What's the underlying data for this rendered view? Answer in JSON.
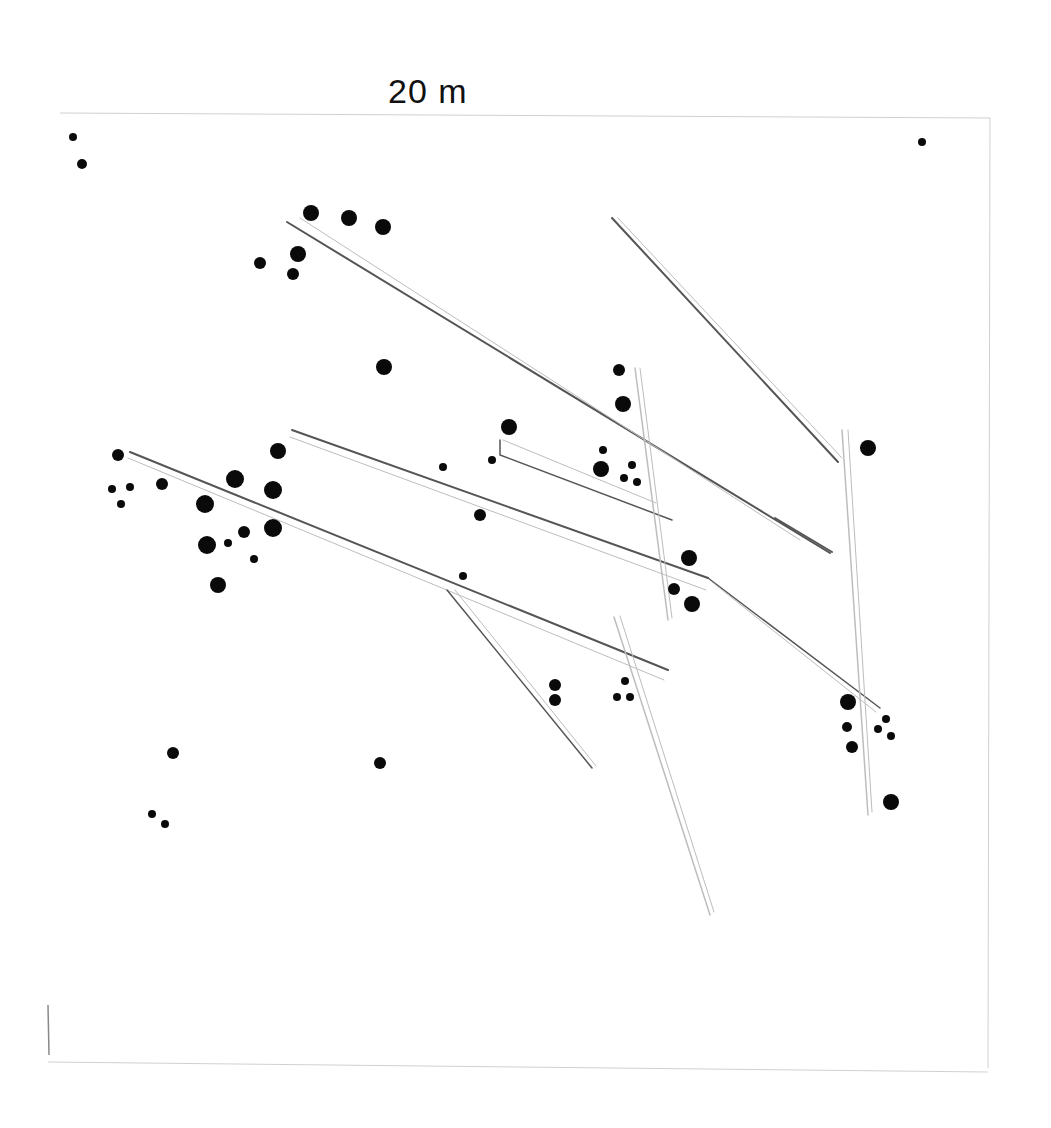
{
  "diagram": {
    "scale_label": "20 m",
    "colors": {
      "ink": "#0a0a0a",
      "line": "#555555",
      "faint": "#bdbdbd",
      "background": "#ffffff"
    },
    "frame": {
      "top": {
        "x1": 60,
        "y1": 113,
        "x2": 990,
        "y2": 118
      },
      "right": {
        "x1": 990,
        "y1": 118,
        "x2": 988,
        "y2": 1068
      },
      "bottom": {
        "x1": 48,
        "y1": 1062,
        "x2": 988,
        "y2": 1072
      },
      "left_mark": {
        "x1": 48,
        "y1": 1005,
        "x2": 49,
        "y2": 1055
      }
    },
    "dots": [
      {
        "x": 73,
        "y": 137,
        "r": 4
      },
      {
        "x": 82,
        "y": 164,
        "r": 5
      },
      {
        "x": 922,
        "y": 142,
        "r": 4
      },
      {
        "x": 311,
        "y": 213,
        "r": 8
      },
      {
        "x": 349,
        "y": 218,
        "r": 8
      },
      {
        "x": 383,
        "y": 227,
        "r": 8
      },
      {
        "x": 298,
        "y": 254,
        "r": 8
      },
      {
        "x": 260,
        "y": 263,
        "r": 6
      },
      {
        "x": 293,
        "y": 274,
        "r": 6
      },
      {
        "x": 384,
        "y": 367,
        "r": 8
      },
      {
        "x": 619,
        "y": 370,
        "r": 6
      },
      {
        "x": 623,
        "y": 404,
        "r": 8
      },
      {
        "x": 509,
        "y": 427,
        "r": 8
      },
      {
        "x": 868,
        "y": 448,
        "r": 8
      },
      {
        "x": 118,
        "y": 455,
        "r": 6
      },
      {
        "x": 278,
        "y": 451,
        "r": 8
      },
      {
        "x": 235,
        "y": 479,
        "r": 9
      },
      {
        "x": 162,
        "y": 484,
        "r": 6
      },
      {
        "x": 112,
        "y": 489,
        "r": 4
      },
      {
        "x": 130,
        "y": 487,
        "r": 4
      },
      {
        "x": 121,
        "y": 504,
        "r": 4
      },
      {
        "x": 273,
        "y": 490,
        "r": 9
      },
      {
        "x": 205,
        "y": 504,
        "r": 9
      },
      {
        "x": 273,
        "y": 528,
        "r": 9
      },
      {
        "x": 244,
        "y": 532,
        "r": 6
      },
      {
        "x": 228,
        "y": 543,
        "r": 4
      },
      {
        "x": 207,
        "y": 545,
        "r": 9
      },
      {
        "x": 254,
        "y": 559,
        "r": 4
      },
      {
        "x": 218,
        "y": 585,
        "r": 8
      },
      {
        "x": 443,
        "y": 467,
        "r": 4
      },
      {
        "x": 492,
        "y": 460,
        "r": 4
      },
      {
        "x": 603,
        "y": 450,
        "r": 4
      },
      {
        "x": 601,
        "y": 469,
        "r": 8
      },
      {
        "x": 632,
        "y": 465,
        "r": 4
      },
      {
        "x": 624,
        "y": 478,
        "r": 4
      },
      {
        "x": 637,
        "y": 482,
        "r": 4
      },
      {
        "x": 480,
        "y": 515,
        "r": 6
      },
      {
        "x": 463,
        "y": 576,
        "r": 4
      },
      {
        "x": 689,
        "y": 558,
        "r": 8
      },
      {
        "x": 674,
        "y": 589,
        "r": 6
      },
      {
        "x": 692,
        "y": 604,
        "r": 8
      },
      {
        "x": 555,
        "y": 685,
        "r": 6
      },
      {
        "x": 555,
        "y": 700,
        "r": 6
      },
      {
        "x": 625,
        "y": 681,
        "r": 4
      },
      {
        "x": 617,
        "y": 697,
        "r": 4
      },
      {
        "x": 630,
        "y": 697,
        "r": 4
      },
      {
        "x": 848,
        "y": 702,
        "r": 8
      },
      {
        "x": 847,
        "y": 727,
        "r": 5
      },
      {
        "x": 852,
        "y": 747,
        "r": 6
      },
      {
        "x": 886,
        "y": 719,
        "r": 4
      },
      {
        "x": 878,
        "y": 729,
        "r": 4
      },
      {
        "x": 891,
        "y": 736,
        "r": 4
      },
      {
        "x": 891,
        "y": 802,
        "r": 8
      },
      {
        "x": 173,
        "y": 753,
        "r": 6
      },
      {
        "x": 380,
        "y": 763,
        "r": 6
      },
      {
        "x": 152,
        "y": 814,
        "r": 4
      },
      {
        "x": 165,
        "y": 824,
        "r": 4
      }
    ],
    "logs": [
      {
        "points": [
          [
            287,
            222
          ],
          [
            830,
            553
          ]
        ],
        "width": 2,
        "tone": "line"
      },
      {
        "points": [
          [
            300,
            218
          ],
          [
            800,
            540
          ]
        ],
        "width": 1,
        "tone": "faint"
      },
      {
        "points": [
          [
            612,
            218
          ],
          [
            838,
            462
          ]
        ],
        "width": 2,
        "tone": "line"
      },
      {
        "points": [
          [
            618,
            218
          ],
          [
            842,
            458
          ]
        ],
        "width": 1,
        "tone": "faint"
      },
      {
        "points": [
          [
            292,
            430
          ],
          [
            708,
            578
          ]
        ],
        "width": 2,
        "tone": "line"
      },
      {
        "points": [
          [
            290,
            437
          ],
          [
            706,
            590
          ]
        ],
        "width": 1,
        "tone": "faint"
      },
      {
        "points": [
          [
            500,
            440
          ],
          [
            500,
            455
          ],
          [
            672,
            520
          ]
        ],
        "width": 1.5,
        "tone": "line"
      },
      {
        "points": [
          [
            503,
            440
          ],
          [
            656,
            503
          ]
        ],
        "width": 1,
        "tone": "faint"
      },
      {
        "points": [
          [
            130,
            452
          ],
          [
            668,
            670
          ]
        ],
        "width": 2,
        "tone": "line"
      },
      {
        "points": [
          [
            128,
            458
          ],
          [
            664,
            680
          ]
        ],
        "width": 1,
        "tone": "faint"
      },
      {
        "points": [
          [
            635,
            368
          ],
          [
            668,
            620
          ]
        ],
        "width": 1.5,
        "tone": "faint"
      },
      {
        "points": [
          [
            640,
            368
          ],
          [
            672,
            618
          ]
        ],
        "width": 1,
        "tone": "faint"
      },
      {
        "points": [
          [
            708,
            578
          ],
          [
            880,
            708
          ]
        ],
        "width": 1.5,
        "tone": "line"
      },
      {
        "points": [
          [
            712,
            582
          ],
          [
            876,
            712
          ]
        ],
        "width": 1,
        "tone": "faint"
      },
      {
        "points": [
          [
            842,
            430
          ],
          [
            868,
            815
          ]
        ],
        "width": 1.5,
        "tone": "faint"
      },
      {
        "points": [
          [
            848,
            430
          ],
          [
            872,
            812
          ]
        ],
        "width": 1,
        "tone": "faint"
      },
      {
        "points": [
          [
            447,
            590
          ],
          [
            592,
            768
          ]
        ],
        "width": 1.5,
        "tone": "line"
      },
      {
        "points": [
          [
            455,
            590
          ],
          [
            596,
            766
          ]
        ],
        "width": 1,
        "tone": "faint"
      },
      {
        "points": [
          [
            614,
            617
          ],
          [
            710,
            915
          ]
        ],
        "width": 1.5,
        "tone": "faint"
      },
      {
        "points": [
          [
            620,
            616
          ],
          [
            714,
            912
          ]
        ],
        "width": 1,
        "tone": "faint"
      },
      {
        "points": [
          [
            775,
            518
          ],
          [
            832,
            552
          ]
        ],
        "width": 2,
        "tone": "line"
      }
    ]
  }
}
